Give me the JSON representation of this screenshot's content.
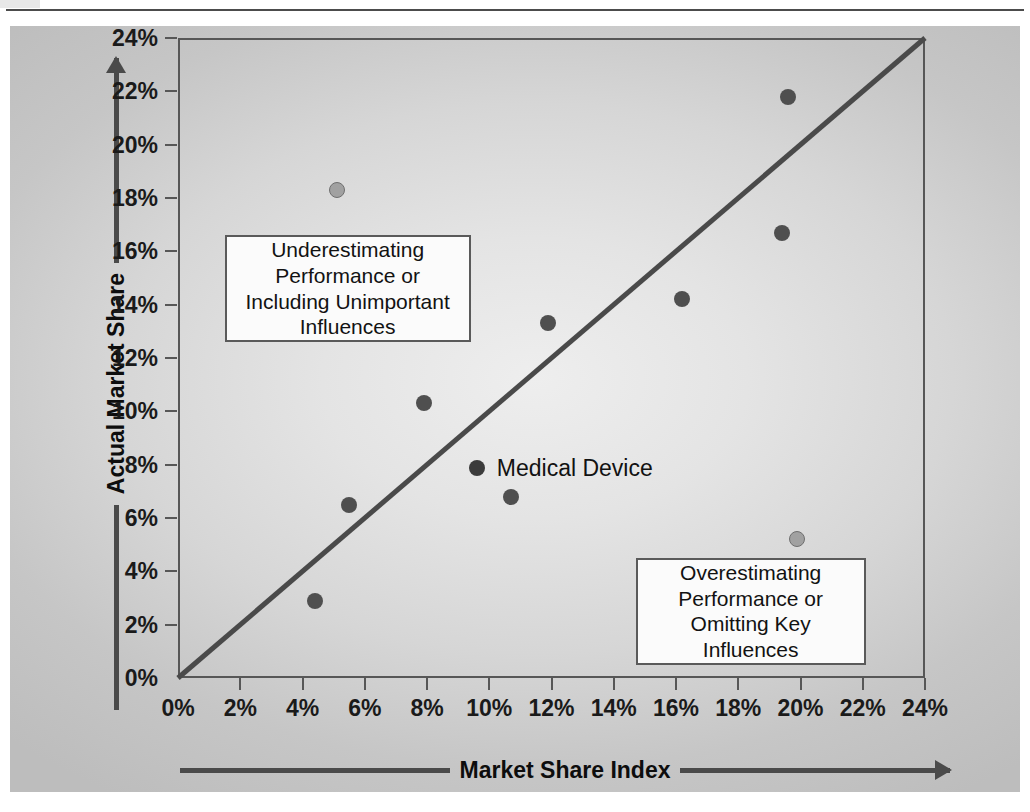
{
  "chart_data": {
    "type": "scatter",
    "title": "",
    "xlabel": "Market Share Index",
    "ylabel": "Actual Market Share",
    "xlim": [
      0,
      24
    ],
    "ylim": [
      0,
      24
    ],
    "xticks": [
      "0%",
      "2%",
      "4%",
      "6%",
      "8%",
      "10%",
      "12%",
      "14%",
      "16%",
      "18%",
      "20%",
      "22%",
      "24%"
    ],
    "yticks": [
      "0%",
      "2%",
      "4%",
      "6%",
      "8%",
      "10%",
      "12%",
      "14%",
      "16%",
      "18%",
      "20%",
      "22%",
      "24%"
    ],
    "grid": false,
    "legend_position": "inside-center",
    "reference_line": {
      "label": "45-degree parity line",
      "from": [
        0,
        0
      ],
      "to": [
        24,
        24
      ],
      "color": "#4a4a4a"
    },
    "series": [
      {
        "name": "Medical Device",
        "marker": "circle",
        "color": "#4f4f4f",
        "points": [
          {
            "x": 4.4,
            "y": 2.9
          },
          {
            "x": 5.5,
            "y": 6.5
          },
          {
            "x": 7.9,
            "y": 10.3
          },
          {
            "x": 10.7,
            "y": 6.8
          },
          {
            "x": 11.9,
            "y": 13.3
          },
          {
            "x": 16.2,
            "y": 14.2
          },
          {
            "x": 19.4,
            "y": 16.7
          },
          {
            "x": 19.6,
            "y": 21.8
          }
        ]
      },
      {
        "name": "Outlier",
        "marker": "circle",
        "color": "#a1a1a1",
        "points": [
          {
            "x": 5.1,
            "y": 18.3
          },
          {
            "x": 19.9,
            "y": 5.2
          }
        ]
      }
    ],
    "annotations": [
      {
        "id": "underestimating",
        "lines": [
          "Underestimating",
          "Performance or",
          "Including Unimportant",
          "Influences"
        ],
        "x_range": [
          1.5,
          9.4
        ],
        "y_range": [
          12.6,
          16.6
        ]
      },
      {
        "id": "overestimating",
        "lines": [
          "Overestimating",
          "Performance or",
          "Omitting Key",
          "Influences"
        ],
        "x_range": [
          14.7,
          22.1
        ],
        "y_range": [
          0.5,
          4.5
        ]
      }
    ]
  },
  "axes": {
    "x_title": "Market Share Index",
    "y_title": "Actual Market Share",
    "x_tick_labels": [
      "0%",
      "2%",
      "4%",
      "6%",
      "8%",
      "10%",
      "12%",
      "14%",
      "16%",
      "18%",
      "20%",
      "22%",
      "24%"
    ],
    "y_tick_labels": [
      "0%",
      "2%",
      "4%",
      "6%",
      "8%",
      "10%",
      "12%",
      "14%",
      "16%",
      "18%",
      "20%",
      "22%",
      "24%"
    ]
  },
  "legend": {
    "series_label": "Medical Device"
  },
  "callouts": {
    "underestimating": {
      "line1": "Underestimating",
      "line2": "Performance or",
      "line3": "Including Unimportant",
      "line4": "Influences"
    },
    "overestimating": {
      "line1": "Overestimating",
      "line2": "Performance or",
      "line3": "Omitting Key",
      "line4": "Influences"
    }
  },
  "colors": {
    "panel_background": "#d6d6d6",
    "marker_dark": "#4f4f4f",
    "marker_light": "#a1a1a1",
    "line": "#4a4a4a",
    "frame": "#575757",
    "text": "#121212"
  }
}
